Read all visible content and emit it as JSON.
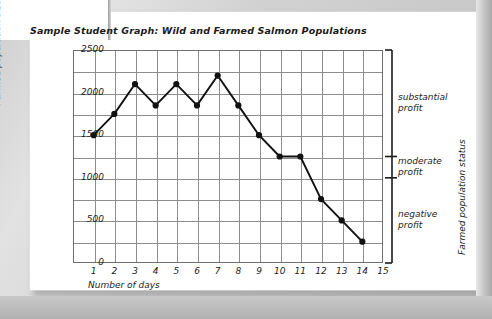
{
  "document": {
    "title": "Sample Student Graph: Wild and Farmed Salmon Populations"
  },
  "chart_data": {
    "type": "line",
    "title": "Sample Student Graph: Wild and Farmed Salmon Populations",
    "xlabel": "Number of days",
    "ylabel": "Farmed population size",
    "ylabel_right": "Farmed population status",
    "x": [
      1,
      2,
      3,
      4,
      5,
      6,
      7,
      8,
      9,
      10,
      11,
      12,
      13,
      14
    ],
    "values": [
      1500,
      1750,
      2100,
      1850,
      2100,
      1850,
      2200,
      1850,
      1500,
      1250,
      1250,
      750,
      500,
      250
    ],
    "series": [
      {
        "name": "Farmed population size",
        "values": [
          1500,
          1750,
          2100,
          1850,
          2100,
          1850,
          2200,
          1850,
          1500,
          1250,
          1250,
          750,
          500,
          250
        ]
      }
    ],
    "xticks": [
      "1",
      "2",
      "3",
      "4",
      "5",
      "6",
      "7",
      "8",
      "9",
      "10",
      "11",
      "12",
      "13",
      "14",
      "15"
    ],
    "xlim": [
      0,
      15
    ],
    "yticks": [
      "0",
      "500",
      "1000",
      "1500",
      "2000",
      "2500"
    ],
    "ylim": [
      0,
      2500
    ],
    "grid": true,
    "legend": "none",
    "marker": "filled-circle",
    "line_color": "#111111",
    "grid_color": "#8d8d8d",
    "annotations": [
      {
        "label": "substantial\nprofit",
        "line1": "substantial",
        "line2": "profit",
        "range": [
          1250,
          2500
        ]
      },
      {
        "label": "moderate\nprofit",
        "line1": "moderate",
        "line2": "profit",
        "range": [
          1000,
          1250
        ]
      },
      {
        "label": "negative\nprofit",
        "line1": "negative",
        "line2": "profit",
        "range": [
          0,
          1000
        ]
      }
    ]
  },
  "axes": {
    "y_ticks": [
      {
        "label": "2500"
      },
      {
        "label": "2000"
      },
      {
        "label": "1500"
      },
      {
        "label": "1000"
      },
      {
        "label": "500"
      },
      {
        "label": "0"
      }
    ],
    "x_ticks": [
      {
        "label": "1"
      },
      {
        "label": "2"
      },
      {
        "label": "3"
      },
      {
        "label": "4"
      },
      {
        "label": "5"
      },
      {
        "label": "6"
      },
      {
        "label": "7"
      },
      {
        "label": "8"
      },
      {
        "label": "9"
      },
      {
        "label": "10"
      },
      {
        "label": "11"
      },
      {
        "label": "12"
      },
      {
        "label": "13"
      },
      {
        "label": "14"
      },
      {
        "label": "15"
      }
    ],
    "x_title": "Number of days",
    "y_title": "Farmed population size",
    "y_right_title": "Farmed population status"
  },
  "brackets": [
    {
      "line1": "substantial",
      "line2": "profit"
    },
    {
      "line1": "moderate",
      "line2": "profit"
    },
    {
      "line1": "negative",
      "line2": "profit"
    }
  ]
}
